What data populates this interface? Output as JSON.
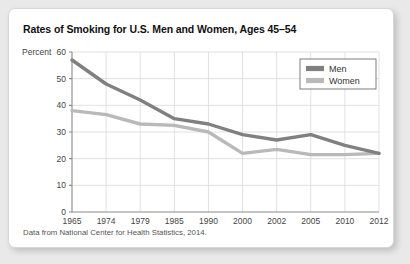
{
  "figure": {
    "title": "Rates of Smoking for U.S. Men and Women, Ages 45–54",
    "source_note": "Data from National Center for Health Statistics, 2014.",
    "axis_unit_label": "Percent"
  },
  "colors": {
    "men_line": "#808080",
    "women_line": "#b9b9b9",
    "grid": "#d9d9d9",
    "axis": "#8a8a8a",
    "card_background": "#ffffff",
    "page_background": "#e9e9e9",
    "title_text": "#111111",
    "tick_text": "#444444"
  },
  "legend": {
    "position": "top-right",
    "entries": [
      {
        "label": "Men",
        "color": "#808080"
      },
      {
        "label": "Women",
        "color": "#b9b9b9"
      }
    ]
  },
  "chart_data": {
    "type": "line",
    "title": "Rates of Smoking for U.S. Men and Women, Ages 45–54",
    "subtitle": "",
    "xlabel": "",
    "ylabel": "Percent",
    "categories": [
      "1965",
      "1974",
      "1979",
      "1985",
      "1990",
      "2000",
      "2002",
      "2005",
      "2010",
      "2012"
    ],
    "xtick_labels": [
      "1965",
      "1974",
      "1979",
      "1985",
      "1990",
      "2000",
      "2002",
      "2005",
      "2010",
      "2012"
    ],
    "ytick_labels": [
      "0",
      "10",
      "20",
      "30",
      "40",
      "50",
      "60"
    ],
    "yticks": [
      0,
      10,
      20,
      30,
      40,
      50,
      60
    ],
    "ylim": [
      0,
      60
    ],
    "grid": true,
    "legend_position": "top-right",
    "annotations": [
      "Data from National Center for Health Statistics, 2014."
    ],
    "series": [
      {
        "name": "Men",
        "color": "#808080",
        "values": [
          57,
          48,
          42,
          35,
          33,
          29,
          27,
          29,
          25,
          22
        ]
      },
      {
        "name": "Women",
        "color": "#b9b9b9",
        "values": [
          38,
          36.5,
          33,
          32.5,
          30,
          22,
          23.5,
          21.5,
          21.5,
          22
        ]
      }
    ]
  }
}
